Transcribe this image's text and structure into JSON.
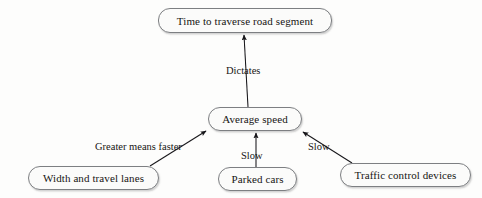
{
  "diagram": {
    "type": "concept-map",
    "title_node": "Time to traverse road segment",
    "style": {
      "background_color": "#fdfdfc",
      "node_fill": "#fbfbfa",
      "node_border_color": "#7d7f82",
      "edge_color": "#17161a",
      "text_color": "#171513"
    },
    "nodes": [
      {
        "id": "time",
        "label": "Time to traverse road segment",
        "x": 158,
        "y": 8,
        "width": 174,
        "height": 25
      },
      {
        "id": "speed",
        "label": "Average speed",
        "x": 208,
        "y": 107,
        "width": 94,
        "height": 24
      },
      {
        "id": "width",
        "label": "Width and travel lanes",
        "x": 28,
        "y": 166,
        "width": 131,
        "height": 24
      },
      {
        "id": "parked",
        "label": "Parked cars",
        "x": 218,
        "y": 167,
        "width": 79,
        "height": 24
      },
      {
        "id": "traffic",
        "label": "Traffic control devices",
        "x": 340,
        "y": 163,
        "width": 131,
        "height": 24
      }
    ],
    "edges": [
      {
        "id": "speed-to-time",
        "from": "speed",
        "to": "time",
        "label": "Dictates",
        "label_x": 226,
        "label_y": 65,
        "x1": 248,
        "y1": 107,
        "x2": 244,
        "y2": 35
      },
      {
        "id": "width-to-speed",
        "from": "width",
        "to": "speed",
        "label": "Greater means faster",
        "label_x": 95,
        "label_y": 141,
        "x1": 150,
        "y1": 166,
        "x2": 206,
        "y2": 131
      },
      {
        "id": "parked-to-speed",
        "from": "parked",
        "to": "speed",
        "label": "Slow",
        "label_x": 241,
        "label_y": 150,
        "x1": 256,
        "y1": 167,
        "x2": 256,
        "y2": 133
      },
      {
        "id": "traffic-to-speed",
        "from": "traffic",
        "to": "speed",
        "label": "Slow",
        "label_x": 308,
        "label_y": 141,
        "x1": 352,
        "y1": 163,
        "x2": 302,
        "y2": 132
      }
    ]
  }
}
